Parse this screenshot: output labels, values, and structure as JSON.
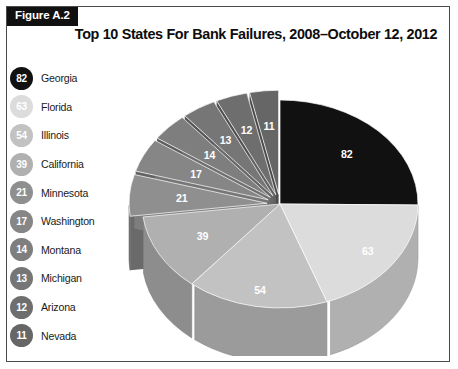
{
  "figure": {
    "label": "Figure A.2",
    "title": "Top 10 States For Bank Failures, 2008–October 12, 2012"
  },
  "colors": {
    "border": "#4a4a4a",
    "label_box": "#111111",
    "background": "#ffffff"
  },
  "legend": {
    "items": [
      {
        "value": "82",
        "label": "Georgia",
        "color": "#111111"
      },
      {
        "value": "63",
        "label": "Florida",
        "color": "#dcdcdc"
      },
      {
        "value": "54",
        "label": "Illinois",
        "color": "#c2c2c2"
      },
      {
        "value": "39",
        "label": "California",
        "color": "#b0b0b0"
      },
      {
        "value": "21",
        "label": "Minnesota",
        "color": "#8f8f8f"
      },
      {
        "value": "17",
        "label": "Washington",
        "color": "#868686"
      },
      {
        "value": "14",
        "label": "Montana",
        "color": "#7e7e7e"
      },
      {
        "value": "13",
        "label": "Michigan",
        "color": "#767676"
      },
      {
        "value": "12",
        "label": "Arizona",
        "color": "#6e6e6e"
      },
      {
        "value": "11",
        "label": "Nevada",
        "color": "#666666"
      }
    ]
  },
  "chart_data": {
    "type": "pie",
    "title": "Top 10 States For Bank Failures, 2008–October 12, 2012",
    "xlabel": "",
    "ylabel": "",
    "legend_position": "left",
    "grid": false,
    "three_d": true,
    "exploded_slices": [
      "21",
      "17",
      "14",
      "13",
      "12",
      "11"
    ],
    "categories": [
      "Georgia",
      "Florida",
      "Illinois",
      "California",
      "Minnesota",
      "Washington",
      "Montana",
      "Michigan",
      "Arizona",
      "Nevada"
    ],
    "values": [
      82,
      63,
      54,
      39,
      21,
      17,
      14,
      13,
      12,
      11
    ],
    "slice_labels": [
      "82",
      "63",
      "54",
      "39",
      "21",
      "17",
      "14",
      "13",
      "12",
      "11"
    ],
    "slice_colors": [
      "#111111",
      "#dcdcdc",
      "#c2c2c2",
      "#b0b0b0",
      "#8f8f8f",
      "#868686",
      "#7e7e7e",
      "#767676",
      "#6e6e6e",
      "#666666"
    ],
    "total": 326
  }
}
